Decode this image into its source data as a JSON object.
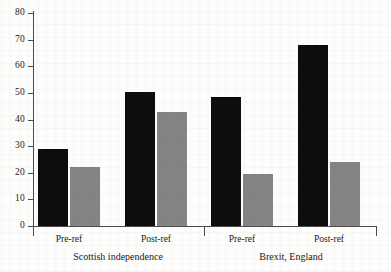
{
  "chart_data": {
    "type": "bar",
    "title": "",
    "subtitle": "",
    "xlabel": "",
    "ylabel": "",
    "ylim": [
      0,
      80
    ],
    "yticks": [
      0,
      10,
      20,
      30,
      40,
      50,
      60,
      70,
      80
    ],
    "grid": false,
    "legend": "none",
    "categories": [
      "Pre-ref",
      "Post-ref",
      "Pre-ref",
      "Post-ref"
    ],
    "groups": [
      {
        "label": "Scottish independence",
        "categories": [
          "Pre-ref",
          "Post-ref"
        ]
      },
      {
        "label": "Brexit, England",
        "categories": [
          "Pre-ref",
          "Post-ref"
        ]
      }
    ],
    "series": [
      {
        "name": "series-1",
        "color": "#0d0d0d",
        "values": [
          29,
          50.5,
          48.5,
          68
        ]
      },
      {
        "name": "series-2",
        "color": "#848484",
        "values": [
          22,
          43,
          19.5,
          24
        ]
      }
    ]
  },
  "axis": {
    "y_tick_labels": [
      "80",
      "70",
      "60",
      "50",
      "40",
      "30",
      "20",
      "10",
      "0"
    ]
  },
  "labels": {
    "cat_0": "Pre-ref",
    "cat_1": "Post-ref",
    "cat_2": "Pre-ref",
    "cat_3": "Post-ref",
    "group_0": "Scottish independence",
    "group_1": "Brexit, England"
  }
}
